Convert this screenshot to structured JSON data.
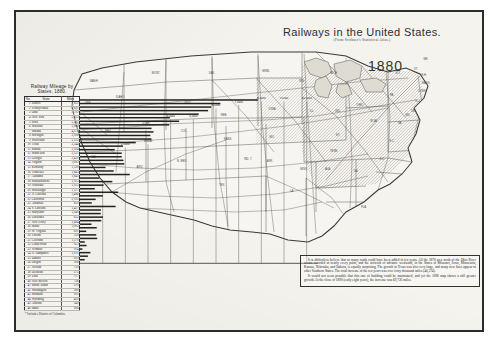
{
  "page": {
    "title": "Railways in the United States.",
    "subtitle": "(From Scribner's Statistical Atlas.)",
    "year": "1880"
  },
  "table": {
    "caption": "Railway Mileage by States.  1880.",
    "headers": [
      "No.",
      "State",
      "Miles"
    ],
    "footnote": "* Includes District of Columbia.",
    "rows": [
      {
        "rank": "1",
        "state": "Illinois",
        "miles": "7,851"
      },
      {
        "rank": "2",
        "state": "Pennsylvania",
        "miles": "6,191"
      },
      {
        "rank": "3",
        "state": "Ohio",
        "miles": "5,792"
      },
      {
        "rank": "4",
        "state": "New York",
        "miles": "5,653"
      },
      {
        "rank": "5",
        "state": "Iowa",
        "miles": "5,235"
      },
      {
        "rank": "6",
        "state": "Missouri",
        "miles": "3,965"
      },
      {
        "rank": "7",
        "state": "Indiana",
        "miles": "4,373"
      },
      {
        "rank": "8",
        "state": "Michigan",
        "miles": "3,938"
      },
      {
        "rank": "9",
        "state": "Wisconsin",
        "miles": "3,155"
      },
      {
        "rank": "10",
        "state": "Texas",
        "miles": "3,244"
      },
      {
        "rank": "11",
        "state": "Kansas",
        "miles": "3,104"
      },
      {
        "rank": "12",
        "state": "Minnesota",
        "miles": "3,151"
      },
      {
        "rank": "13",
        "state": "Georgia",
        "miles": "2,459"
      },
      {
        "rank": "14",
        "state": "Virginia",
        "miles": "1,893"
      },
      {
        "rank": "15",
        "state": "Kentucky",
        "miles": "1,530"
      },
      {
        "rank": "16",
        "state": "Tennessee",
        "miles": "1,843"
      },
      {
        "rank": "17",
        "state": "Alabama",
        "miles": "1,843"
      },
      {
        "rank": "18",
        "state": "Massachusetts",
        "miles": "1,915"
      },
      {
        "rank": "19",
        "state": "Nebraska",
        "miles": "1,953"
      },
      {
        "rank": "20",
        "state": "Mississippi",
        "miles": "1,127"
      },
      {
        "rank": "21",
        "state": "N. Carolina",
        "miles": "1,486"
      },
      {
        "rank": "22",
        "state": "California",
        "miles": "2,195"
      },
      {
        "rank": "23",
        "state": "Arkansas",
        "miles": "  859"
      },
      {
        "rank": "24",
        "state": "S. Carolina",
        "miles": "1,427"
      },
      {
        "rank": "25",
        "state": "Maryland*",
        "miles": "1,040"
      },
      {
        "rank": "26",
        "state": "Louisiana",
        "miles": "  652"
      },
      {
        "rank": "27",
        "state": "New Jersey",
        "miles": "1,684"
      },
      {
        "rank": "28",
        "state": "Maine",
        "miles": "1,005"
      },
      {
        "rank": "29",
        "state": "W. Virginia",
        "miles": "  691"
      },
      {
        "rank": "30",
        "state": "Florida",
        "miles": "  518"
      },
      {
        "rank": "31",
        "state": "Colorado",
        "miles": "1,570"
      },
      {
        "rank": "32",
        "state": "Connecticut",
        "miles": "  923"
      },
      {
        "rank": "33",
        "state": "Vermont",
        "miles": "  914"
      },
      {
        "rank": "34",
        "state": "N. Hampshire",
        "miles": "1,015"
      },
      {
        "rank": "35",
        "state": "Dakota",
        "miles": "  939"
      },
      {
        "rank": "36",
        "state": "Oregon",
        "miles": "  508"
      },
      {
        "rank": "37",
        "state": "Nevada",
        "miles": "  739"
      },
      {
        "rank": "38",
        "state": "Delaware",
        "miles": "  275"
      },
      {
        "rank": "39",
        "state": "Utah",
        "miles": "  717"
      },
      {
        "rank": "40",
        "state": "New Mexico",
        "miles": "  758"
      },
      {
        "rank": "41",
        "state": "Rhode Island",
        "miles": "  210"
      },
      {
        "rank": "42",
        "state": "Washington",
        "miles": "  289"
      },
      {
        "rank": "43",
        "state": "Montana",
        "miles": "  105"
      },
      {
        "rank": "44",
        "state": "Wyoming",
        "miles": "  459"
      },
      {
        "rank": "45",
        "state": "Arizona",
        "miles": "  349"
      },
      {
        "rank": "46",
        "state": "Idaho",
        "miles": "  206"
      }
    ]
  },
  "chart_data": {
    "type": "bar",
    "title": "Railway Mileage by States.  1880.",
    "orientation": "horizontal",
    "xlabel": "",
    "ylabel": "",
    "xlim": [
      0,
      10500
    ],
    "grid": true,
    "gridlines": [
      1000,
      2000,
      3000,
      4000,
      5000,
      6000,
      7000,
      8000,
      9000,
      10000
    ],
    "tick_labels": [
      "1,000",
      "2,000",
      "3,000",
      "4,000",
      "5,000",
      "6,000",
      "7,000",
      "8,000",
      "9,000",
      "10,000"
    ],
    "categories": [
      "Illinois",
      "Pennsylvania",
      "Ohio",
      "New York",
      "Iowa",
      "Missouri",
      "Indiana",
      "Michigan",
      "Wisconsin",
      "Texas",
      "Kansas",
      "Minnesota",
      "Georgia",
      "Virginia",
      "Kentucky",
      "Tennessee",
      "Alabama",
      "Massachusetts",
      "Nebraska",
      "Mississippi",
      "N. Carolina",
      "California",
      "Arkansas",
      "S. Carolina",
      "Maryland*",
      "Louisiana",
      "New Jersey",
      "Maine",
      "W. Virginia",
      "Florida",
      "Colorado",
      "Connecticut",
      "Vermont",
      "N. Hampshire",
      "Dakota",
      "Oregon",
      "Nevada",
      "Delaware",
      "Utah",
      "New Mexico",
      "Rhode Island",
      "Washington",
      "Montana",
      "Wyoming",
      "Arizona",
      "Idaho"
    ],
    "values": [
      7851,
      6191,
      5792,
      5653,
      5235,
      3965,
      4373,
      3938,
      3155,
      3244,
      3104,
      3151,
      2459,
      1893,
      1530,
      1843,
      1843,
      1915,
      1953,
      1127,
      1486,
      2195,
      859,
      1427,
      1040,
      652,
      1684,
      1005,
      691,
      518,
      1570,
      923,
      914,
      1015,
      939,
      508,
      739,
      275,
      717,
      758,
      210,
      289,
      105,
      459,
      349,
      206
    ]
  },
  "note": {
    "paragraphs": [
      "It is difficult to believe that so many roads could have been added in ten years.  All the 1870 area north of the Ohio River seems crowded at nearly every point, and the network of advance westward, in the States of Missouri, Iowa, Minnesota, Kansas, Nebraska, and Dakota, is equally surprising.  The growth in Texas was also very large, and many new lines appear in other Southern States.  The total increase of the ten years was over forty thousand miles (40,374).",
      "It would not seem possible that this rate of building could be maintained, and yet the 1890 map shows a still greater growth.  At the close of 1890 (early eight years), the increase was 69,726 miles."
    ]
  },
  "map": {
    "region_labels": [
      "WASH.",
      "ORE.",
      "IDAHO",
      "MONT.",
      "DAK.",
      "MINN.",
      "WIS.",
      "MICH.",
      "NEV.",
      "UTAH",
      "WYO.",
      "NEB.",
      "IOWA",
      "ILL.",
      "IND.",
      "OHIO",
      "PA.",
      "CAL.",
      "ARIZ.",
      "N. MEX.",
      "COL.",
      "KANS.",
      "MO.",
      "KY.",
      "W.VA.",
      "VA.",
      "TEX.",
      "IND. T.",
      "ARK.",
      "TENN.",
      "N.C.",
      "S.C.",
      "GA.",
      "ALA.",
      "MISS.",
      "LA.",
      "FLA.",
      "N.Y.",
      "ME.",
      "VT.",
      "N.H.",
      "MASS.",
      "CONN.",
      "N.J.",
      "DEL.",
      "MD."
    ]
  }
}
